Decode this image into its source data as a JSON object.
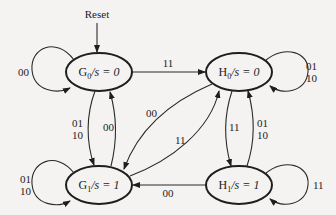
{
  "diagram": {
    "type": "state-machine",
    "reset": {
      "label": "Reset",
      "target": "G0"
    },
    "states": [
      {
        "id": "G0",
        "name": "G",
        "sub": "0",
        "output": "s = 0",
        "cx": 99,
        "cy": 72
      },
      {
        "id": "H0",
        "name": "H",
        "sub": "0",
        "output": "s = 0",
        "cx": 239,
        "cy": 72
      },
      {
        "id": "G1",
        "name": "G",
        "sub": "1",
        "output": "s = 1",
        "cx": 99,
        "cy": 185
      },
      {
        "id": "H1",
        "name": "H",
        "sub": "1",
        "output": "s = 1",
        "cx": 239,
        "cy": 185
      }
    ],
    "transitions": [
      {
        "from": "G0",
        "to": "G0",
        "label": [
          "00"
        ]
      },
      {
        "from": "G0",
        "to": "H0",
        "label": [
          "11"
        ]
      },
      {
        "from": "G0",
        "to": "G1",
        "label": [
          "01",
          "10"
        ]
      },
      {
        "from": "G1",
        "to": "G0",
        "label": [
          "00"
        ]
      },
      {
        "from": "H0",
        "to": "H0",
        "label": [
          "01",
          "10"
        ]
      },
      {
        "from": "H0",
        "to": "G1",
        "label": [
          "00"
        ]
      },
      {
        "from": "G1",
        "to": "H0",
        "label": [
          "11"
        ]
      },
      {
        "from": "H0",
        "to": "H1",
        "label": [
          "11"
        ]
      },
      {
        "from": "H1",
        "to": "H0",
        "label": [
          "01",
          "10"
        ]
      },
      {
        "from": "G1",
        "to": "G1",
        "label": [
          "01",
          "10"
        ]
      },
      {
        "from": "H1",
        "to": "G1",
        "label": [
          "00"
        ]
      },
      {
        "from": "H1",
        "to": "H1",
        "label": [
          "11"
        ]
      }
    ]
  },
  "labels": {
    "reset": "Reset",
    "g0_self": "00",
    "g0_h0": "11",
    "g0_g1_a": "01",
    "g0_g1_b": "10",
    "g1_g0": "00",
    "h0_self_a": "01",
    "h0_self_b": "10",
    "h0_g1": "00",
    "g1_h0": "11",
    "h0_h1": "11",
    "h1_h0_a": "01",
    "h1_h0_b": "10",
    "g1_self_a": "01",
    "g1_self_b": "10",
    "h1_g1": "00",
    "h1_self": "11",
    "g0": {
      "name": "G",
      "sub": "0",
      "rest": "/s = 0"
    },
    "h0": {
      "name": "H",
      "sub": "0",
      "rest": "/s = 0"
    },
    "g1": {
      "name": "G",
      "sub": "1",
      "rest": "/s = 1"
    },
    "h1": {
      "name": "H",
      "sub": "1",
      "rest": "/s = 1"
    }
  }
}
